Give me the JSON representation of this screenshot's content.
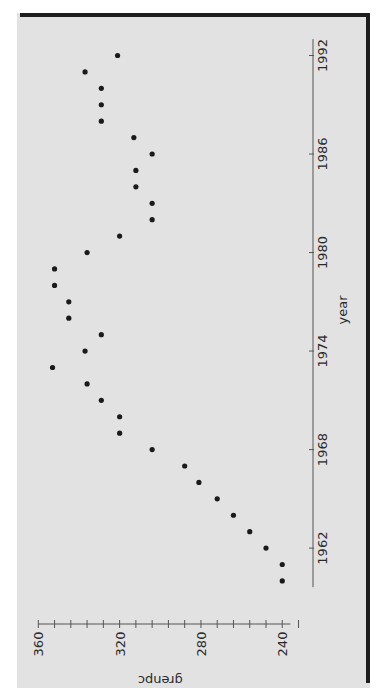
{
  "chart_data": {
    "type": "scatter",
    "title": "",
    "orientation_note": "figure rotated 90 degrees clockwise",
    "xlabel": "year",
    "ylabel": "grenpc",
    "xlim": [
      1959.5,
      1993
    ],
    "ylim": [
      236,
      360
    ],
    "xticks": [
      1962,
      1968,
      1974,
      1980,
      1986,
      1992
    ],
    "yticks": [
      240,
      280,
      320,
      360
    ],
    "yminor_step": 8,
    "grid": false,
    "legend": null,
    "series": [
      {
        "name": "grenpc",
        "marker": "filled-circle",
        "color": "#1a1a1a",
        "x": [
          1960,
          1961,
          1962,
          1963,
          1964,
          1965,
          1966,
          1967,
          1968,
          1969,
          1970,
          1971,
          1972,
          1973,
          1974,
          1975,
          1976,
          1977,
          1978,
          1979,
          1980,
          1981,
          1982,
          1983,
          1984,
          1985,
          1986,
          1987,
          1988,
          1989,
          1990,
          1991,
          1992
        ],
        "y": [
          240,
          240,
          248,
          256,
          264,
          272,
          281,
          288,
          304,
          320,
          320,
          329,
          336,
          353,
          337,
          329,
          345,
          345,
          352,
          352,
          336,
          320,
          304,
          304,
          312,
          312,
          304,
          313,
          329,
          329,
          329,
          337,
          321
        ]
      }
    ]
  },
  "axes": {
    "x_title": "year",
    "y_title": "grenpc",
    "x_tick_labels": [
      "1962",
      "1968",
      "1974",
      "1980",
      "1986",
      "1992"
    ],
    "y_tick_labels": [
      "360",
      "320",
      "280",
      "240"
    ]
  },
  "colors": {
    "page_bg": "#e2e2e2",
    "frame": "#1e1e1e",
    "ink": "#2a2a2a",
    "marker": "#1a1a1a"
  }
}
